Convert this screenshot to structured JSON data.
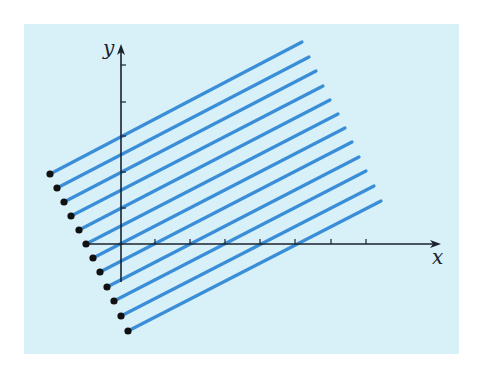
{
  "figure": {
    "background_color": "#d8f0f8",
    "line_color": "#3a8ed8",
    "axis_color": "#1a2330",
    "dot_color": "#111111",
    "panel": {
      "x": 24,
      "y": 24,
      "width": 435,
      "height": 330
    },
    "axes": {
      "origin": [
        121,
        244
      ],
      "x_axis": {
        "from": 86,
        "to": 441,
        "label": "x",
        "ticks": [
          155,
          190,
          225,
          260,
          295,
          331,
          366
        ]
      },
      "y_axis": {
        "from": 282,
        "to": 44,
        "label": "y",
        "ticks": [
          65,
          102,
          136,
          172,
          208
        ]
      }
    },
    "segments": [
      {
        "start": [
          50,
          174
        ],
        "end": [
          302,
          42
        ]
      },
      {
        "start": [
          57,
          188
        ],
        "end": [
          309,
          57
        ]
      },
      {
        "start": [
          64,
          202
        ],
        "end": [
          316,
          71
        ]
      },
      {
        "start": [
          71,
          216
        ],
        "end": [
          323,
          86
        ]
      },
      {
        "start": [
          79,
          230
        ],
        "end": [
          330,
          100
        ]
      },
      {
        "start": [
          86,
          244
        ],
        "end": [
          338,
          114
        ]
      },
      {
        "start": [
          93,
          258
        ],
        "end": [
          345,
          128
        ]
      },
      {
        "start": [
          100,
          272
        ],
        "end": [
          352,
          142
        ]
      },
      {
        "start": [
          107,
          287
        ],
        "end": [
          359,
          157
        ]
      },
      {
        "start": [
          114,
          301
        ],
        "end": [
          366,
          171
        ]
      },
      {
        "start": [
          121,
          316
        ],
        "end": [
          374,
          186
        ]
      },
      {
        "start": [
          128,
          331
        ],
        "end": [
          381,
          201
        ]
      }
    ]
  }
}
